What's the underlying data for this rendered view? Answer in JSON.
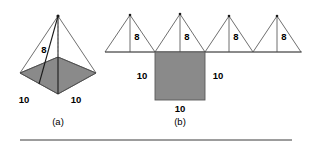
{
  "figure": {
    "caption_a": "(a)",
    "caption_b": "(b)",
    "colors": {
      "shaded_fill": "#8a8a8a",
      "line": "#4a4a4a",
      "line_dark": "#1a1a1a",
      "dashed": "#9a9a9a",
      "text": "#000000",
      "background": "#ffffff",
      "rule": "#3a3a3a"
    },
    "part_a": {
      "name": "square-pyramid-3d",
      "slant_height_label": "8",
      "base_edge_left_label": "10",
      "base_edge_right_label": "10",
      "caption": "(a)"
    },
    "part_b": {
      "name": "pyramid-net-unfolded",
      "triangle_labels": [
        "8",
        "8",
        "8",
        "8"
      ],
      "square_left_label": "10",
      "square_right_label": "10",
      "square_bottom_label": "10",
      "caption": "(b)"
    }
  }
}
